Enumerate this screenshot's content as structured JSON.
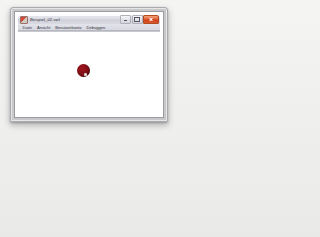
{
  "desktop": {
    "background_color": "#f1f1f0"
  },
  "window": {
    "title": "Beispiel_02.swf",
    "app_icon_name": "flash-document-icon",
    "frame_color": "#c4c4c8",
    "titlebar_color": "#dcdce4",
    "buttons": {
      "minimize_label": "Minimieren",
      "maximize_label": "Maximieren",
      "close_label": "Schließen",
      "close_color": "#d9572c"
    },
    "menubar": {
      "items": [
        {
          "label": "Datei"
        },
        {
          "label": "Ansicht"
        },
        {
          "label": "Benutzerkonto"
        },
        {
          "label": "Debuggen"
        }
      ]
    },
    "canvas": {
      "background_color": "#ffffff",
      "objects": [
        {
          "name": "red-ball",
          "shape": "circle",
          "color": "#7d0d14",
          "diameter_px": 13,
          "left_px": 59,
          "top_px": 32
        }
      ]
    }
  }
}
